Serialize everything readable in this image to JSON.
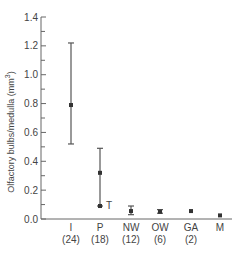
{
  "chart_data": {
    "type": "scatter",
    "title": "",
    "xlabel": "",
    "ylabel": "Olfactory bulbs/medulla (mm³)",
    "ylabel_text": "Olfactory bulbs/medulla (mm",
    "ylabel_sup": "3",
    "ylabel_close": ")",
    "ylim": [
      0.0,
      1.4
    ],
    "yticks": [
      "0.0",
      "0.2",
      "0.4",
      "0.6",
      "0.8",
      "1.0",
      "1.2",
      "1.4"
    ],
    "grid": false,
    "legend": null,
    "categories": [
      "I",
      "P",
      "NW",
      "OW",
      "GA",
      "M"
    ],
    "counts": [
      "(24)",
      "(18)",
      "(12)",
      "(6)",
      "(2)",
      ""
    ],
    "series": [
      {
        "name": "mean",
        "values": [
          0.79,
          0.32,
          0.055,
          0.05,
          0.055,
          0.025
        ],
        "err_low": [
          0.52,
          0.09,
          0.03,
          0.04,
          null,
          null
        ],
        "err_high": [
          1.22,
          0.49,
          0.09,
          0.065,
          null,
          null
        ]
      }
    ],
    "annotations": [
      {
        "text": "T",
        "category": "P",
        "y": 0.09
      }
    ]
  }
}
